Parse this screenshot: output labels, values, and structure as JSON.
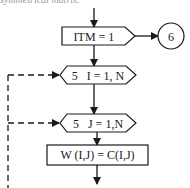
{
  "caption": "symmetrical matrix.",
  "flowchart": {
    "init_box": {
      "label": "ITM = 1"
    },
    "connector": {
      "label": "6"
    },
    "loop_outer": {
      "label": "5   I = 1, N"
    },
    "loop_inner": {
      "label": "5   J = 1,N"
    },
    "assign_box": {
      "label": "W (I,J) = C(I,J)"
    }
  },
  "colors": {
    "stroke": "#1a1a1a",
    "background": "#ffffff"
  }
}
